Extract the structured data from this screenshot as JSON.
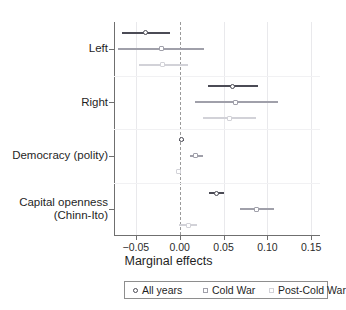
{
  "chart_data": {
    "type": "scatter",
    "subtype": "coefficient-plot",
    "title": "",
    "xlabel": "Marginal effects",
    "ylabel": "",
    "xlim": [
      -0.075,
      0.16
    ],
    "xticks": [
      -0.05,
      0.0,
      0.05,
      0.1,
      0.15
    ],
    "xticklabels": [
      "−0.05",
      "0.00",
      "0.05",
      "0.10",
      "0.15"
    ],
    "grid": true,
    "reference_line": 0.0,
    "legend_position": "bottom",
    "categories": [
      "Left",
      "Right",
      "Democracy (polity)",
      "Capital openness\n(Chinn-Ito)"
    ],
    "series": [
      {
        "name": "All years",
        "marker": "circle-open",
        "color": "#4b4b55",
        "points": [
          {
            "category": "Left",
            "estimate": -0.039,
            "low": -0.066,
            "high": -0.011
          },
          {
            "category": "Right",
            "estimate": 0.06,
            "low": 0.032,
            "high": 0.089
          },
          {
            "category": "Democracy (polity)",
            "estimate": 0.002,
            "low": -0.001,
            "high": 0.005
          },
          {
            "category": "Capital openness\n(Chinn-Ito)",
            "estimate": 0.042,
            "low": 0.033,
            "high": 0.05
          }
        ]
      },
      {
        "name": "Cold War",
        "marker": "square-open",
        "color": "#a0a0aa",
        "points": [
          {
            "category": "Left",
            "estimate": -0.021,
            "low": -0.07,
            "high": 0.028
          },
          {
            "category": "Right",
            "estimate": 0.064,
            "low": 0.017,
            "high": 0.112
          },
          {
            "category": "Democracy (polity)",
            "estimate": 0.018,
            "low": 0.012,
            "high": 0.026
          },
          {
            "category": "Capital openness\n(Chinn-Ito)",
            "estimate": 0.088,
            "low": 0.069,
            "high": 0.107
          }
        ]
      },
      {
        "name": "Post-Cold War",
        "marker": "square-open",
        "color": "#d2d2d8",
        "points": [
          {
            "category": "Left",
            "estimate": -0.02,
            "low": -0.047,
            "high": 0.01
          },
          {
            "category": "Right",
            "estimate": 0.057,
            "low": 0.026,
            "high": 0.087
          },
          {
            "category": "Democracy (polity)",
            "estimate": -0.001,
            "low": -0.004,
            "high": 0.002
          },
          {
            "category": "Capital openness\n(Chinn-Ito)",
            "estimate": 0.01,
            "low": -0.001,
            "high": 0.02
          }
        ]
      }
    ]
  },
  "axis": {
    "xlabel": "Marginal effects",
    "ticklabels": [
      "−0.05",
      "0.00",
      "0.05",
      "0.10",
      "0.15"
    ]
  },
  "ylabels": [
    {
      "line1": "Left",
      "line2": ""
    },
    {
      "line1": "Right",
      "line2": ""
    },
    {
      "line1": "Democracy (polity)",
      "line2": ""
    },
    {
      "line1": "Capital openness",
      "line2": "(Chinn-Ito)"
    }
  ],
  "legend": {
    "items": [
      {
        "label": "All years",
        "shape": "circle-open",
        "color": "#4b4b55"
      },
      {
        "label": "Cold War",
        "shape": "square-open",
        "color": "#a0a0aa"
      },
      {
        "label": "Post-Cold War",
        "shape": "square-open",
        "color": "#d2d2d8"
      }
    ]
  }
}
